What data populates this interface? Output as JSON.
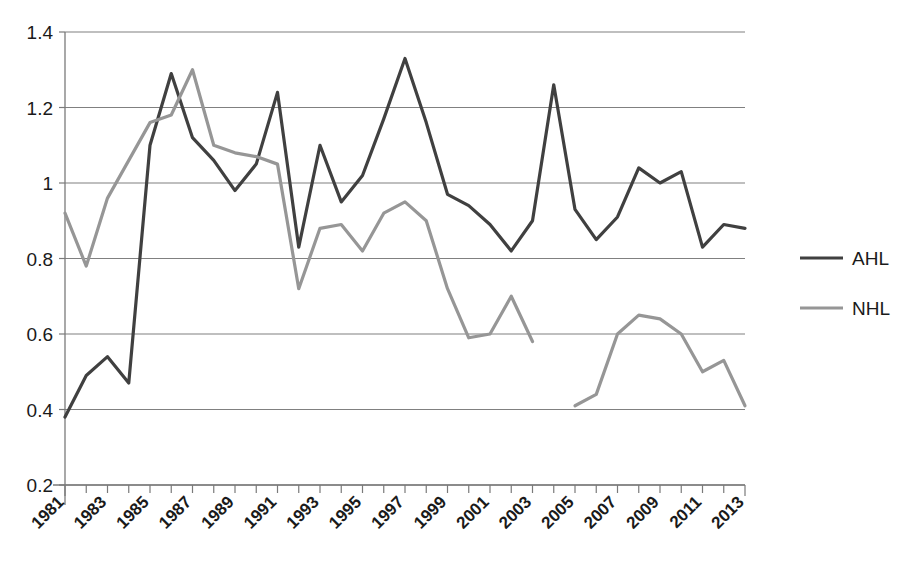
{
  "chart_data": {
    "type": "line",
    "title": "",
    "subtitle": "",
    "xlabel": "",
    "ylabel": "",
    "xlim": [
      1981,
      2013
    ],
    "ylim": [
      0.2,
      1.4
    ],
    "ytick_values": [
      0.2,
      0.4,
      0.6,
      0.8,
      1.0,
      1.2,
      1.4
    ],
    "ytick_labels": [
      "0.2",
      "0.4",
      "0.6",
      "0.8",
      "1",
      "1.2",
      "1.4"
    ],
    "grid": true,
    "grid_axis": "y",
    "legend_position": "right",
    "x": [
      1981,
      1982,
      1983,
      1984,
      1985,
      1986,
      1987,
      1988,
      1989,
      1990,
      1991,
      1992,
      1993,
      1994,
      1995,
      1996,
      1997,
      1998,
      1999,
      2000,
      2001,
      2002,
      2003,
      2004,
      2005,
      2006,
      2007,
      2008,
      2009,
      2010,
      2011,
      2012,
      2013
    ],
    "xtick_labels": [
      "1981",
      "",
      "1983",
      "",
      "1985",
      "",
      "1987",
      "",
      "1989",
      "",
      "1991",
      "",
      "1993",
      "",
      "1995",
      "",
      "1997",
      "",
      "1999",
      "",
      "2001",
      "",
      "2003",
      "",
      "2005",
      "",
      "2007",
      "",
      "2009",
      "",
      "2011",
      "",
      "2013"
    ],
    "xtick_labels_shown": [
      "1981",
      "1983",
      "1985",
      "1987",
      "1989",
      "1991",
      "1993",
      "1995",
      "1997",
      "1999",
      "2001",
      "2003",
      "2005",
      "2007",
      "2009",
      "2011",
      "2013"
    ],
    "series": [
      {
        "name": "AHL",
        "color": "#404040",
        "linewidth": 3.2,
        "values": [
          0.38,
          0.49,
          0.54,
          0.47,
          1.1,
          1.29,
          1.12,
          1.06,
          0.98,
          1.05,
          1.24,
          0.83,
          1.1,
          0.95,
          1.02,
          1.17,
          1.33,
          1.16,
          0.97,
          0.94,
          0.89,
          0.82,
          0.9,
          1.26,
          0.93,
          0.85,
          0.91,
          1.04,
          1.0,
          1.03,
          0.83,
          0.89,
          0.88
        ]
      },
      {
        "name": "NHL",
        "color": "#969696",
        "linewidth": 3.2,
        "values": [
          0.92,
          0.78,
          0.96,
          1.06,
          1.16,
          1.18,
          1.3,
          1.1,
          1.08,
          1.07,
          1.05,
          0.72,
          0.88,
          0.89,
          0.82,
          0.92,
          0.95,
          0.9,
          0.72,
          0.59,
          0.6,
          0.7,
          0.58,
          null,
          0.41,
          0.44,
          0.6,
          0.65,
          0.64,
          0.6,
          0.5,
          0.53,
          0.41
        ]
      }
    ],
    "notes": {
      "gap_series": "NHL",
      "gap_year": 2004
    }
  },
  "legend": {
    "items": [
      {
        "label": "AHL",
        "color": "#404040"
      },
      {
        "label": "NHL",
        "color": "#969696"
      }
    ]
  },
  "axes": {
    "y_axis_name": "value-axis",
    "x_axis_name": "year-axis"
  }
}
